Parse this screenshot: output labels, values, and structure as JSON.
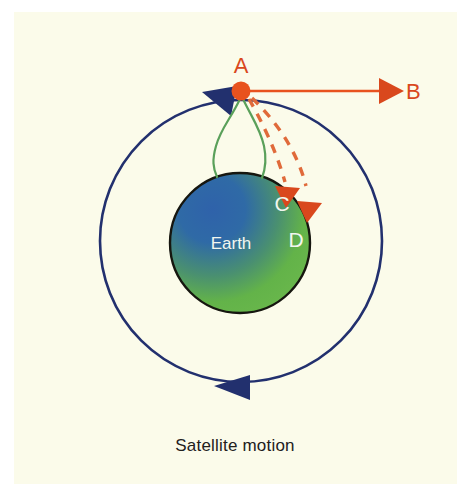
{
  "figure": {
    "caption": "Satellite motion",
    "background_color": "#fbfbea",
    "page_color": "#ffffff"
  },
  "colors": {
    "orbit": "#22306e",
    "satellite": "#e8521e",
    "trajectory": "#e06a3a",
    "tether": "#5aa05a",
    "earth_blue": "#2e5fa3",
    "earth_green": "#63b449",
    "earth_outline": "#16160f",
    "label_light": "#f2f6ef",
    "caption_text": "#22201c"
  },
  "labels": {
    "point_a": "A",
    "point_b": "B",
    "point_c": "C",
    "point_d": "D",
    "earth": "Earth"
  },
  "geometry": {
    "orbit": {
      "cx": 241,
      "cy": 241,
      "r": 141
    },
    "earth": {
      "cx": 240,
      "cy": 243,
      "r": 70
    },
    "satellite": {
      "cx": 241,
      "cy": 91,
      "r": 9
    }
  },
  "icons": {
    "orbit_arrow_top": "arrow-left-triangle",
    "orbit_arrow_bottom": "arrow-left-triangle",
    "velocity_arrow": "arrow-right-triangle",
    "trajectory_arrow_c": "arrow-down-triangle",
    "trajectory_arrow_d": "arrow-down-triangle",
    "satellite_marker": "satellite-dot"
  }
}
